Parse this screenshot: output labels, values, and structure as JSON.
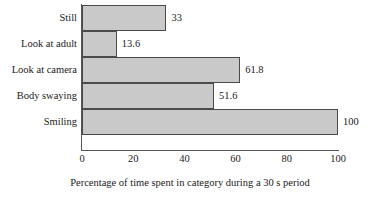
{
  "chart_data": {
    "type": "bar",
    "orientation": "horizontal",
    "title": "",
    "xlabel": "Percentage of time spent in category during a 30 s period",
    "ylabel": "",
    "categories": [
      "Still",
      "Look at adult",
      "Look at camera",
      "Body swaying",
      "Smiling"
    ],
    "values": [
      33,
      13.6,
      61.8,
      51.6,
      100
    ],
    "value_labels": [
      "33",
      "13.6",
      "61.8",
      "51.6",
      "100"
    ],
    "xlim": [
      0,
      100
    ],
    "xticks": [
      0,
      20,
      40,
      60,
      80,
      100
    ],
    "xtick_labels": [
      "0",
      "20",
      "40",
      "60",
      "80",
      "100"
    ],
    "grid": false,
    "legend": null,
    "bar_color": "#c9c9c9",
    "bar_border_color": "#4a4a4a",
    "axis_color": "#555555"
  }
}
